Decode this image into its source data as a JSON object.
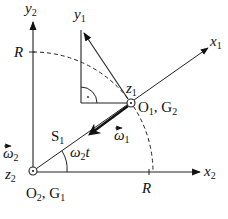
{
  "diagram": {
    "axes": {
      "y2": {
        "label": "y",
        "sub": "2"
      },
      "x2": {
        "label": "x",
        "sub": "2"
      },
      "y1": {
        "label": "y",
        "sub": "1"
      },
      "x1": {
        "label": "x",
        "sub": "1"
      },
      "z1": {
        "label": "z",
        "sub": "1"
      },
      "z2": {
        "label": "z",
        "sub": "2"
      }
    },
    "radius_label": "R",
    "points": {
      "o1": {
        "label": "O",
        "sub": "1",
        "suffix": ", G",
        "suffix_sub": "2"
      },
      "o2": {
        "label": "O",
        "sub": "2",
        "suffix": ", G",
        "suffix_sub": "1"
      }
    },
    "vectors": {
      "omega1": {
        "label": "ω",
        "sub": "1"
      },
      "omega2": {
        "label": "ω",
        "sub": "2"
      }
    },
    "segment_label": {
      "label": "S",
      "sub": "1"
    },
    "angle_label": {
      "label": "ω",
      "sub": "2",
      "suffix": "t"
    }
  }
}
